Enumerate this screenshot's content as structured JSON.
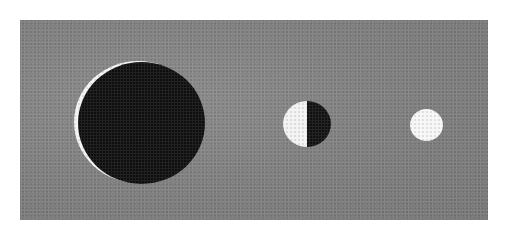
{
  "figure": {
    "background_color": "#7f7f7f",
    "discs": [
      {
        "name": "large-black-disc",
        "fill": "#0e0e0e",
        "rim": "#f4f4f4"
      },
      {
        "name": "medium-half-white-half-black-disc",
        "left_fill": "#f3f3f3",
        "right_fill": "#111111"
      },
      {
        "name": "small-white-disc",
        "fill": "#f6f6f6"
      }
    ]
  }
}
